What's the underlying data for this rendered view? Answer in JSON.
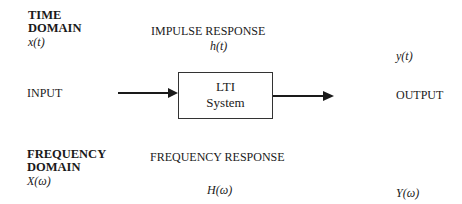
{
  "time_domain": {
    "heading_line1": "TIME",
    "heading_line2": "DOMAIN",
    "input_signal": "x(t)",
    "impulse_response_label": "IMPULSE RESPONSE",
    "impulse_response_symbol": "h(t)",
    "output_signal": "y(t)"
  },
  "system": {
    "input_label": "INPUT",
    "box_line1": "LTI",
    "box_line2": "System",
    "output_label": "OUTPUT"
  },
  "frequency_domain": {
    "heading_line1": "FREQUENCY",
    "heading_line2": "DOMAIN",
    "input_signal": "X(ω)",
    "frequency_response_label": "FREQUENCY RESPONSE",
    "frequency_response_symbol": "H(ω)",
    "output_signal": "Y(ω)"
  },
  "colors": {
    "stroke": "#1a1a1a",
    "background": "#ffffff"
  }
}
